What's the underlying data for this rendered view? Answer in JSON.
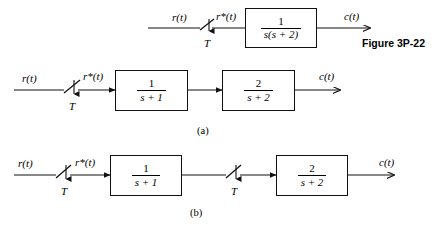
{
  "figure": {
    "caption": "Figure 3P-22",
    "caption_x": 362,
    "caption_y": 40
  },
  "labels": {
    "input": "r(t)",
    "sampled": "r*(t)",
    "output": "c(t)",
    "sampler_period": "T",
    "part_a": "(a)",
    "part_b": "(b)"
  },
  "blocks": {
    "top": {
      "numerator": "1",
      "denominator": "s(s + 2)"
    },
    "a_first": {
      "numerator": "1",
      "denominator": "s + 1"
    },
    "a_second": {
      "numerator": "2",
      "denominator": "s + 2"
    },
    "b_first": {
      "numerator": "1",
      "denominator": "s + 1"
    },
    "b_second": {
      "numerator": "2",
      "denominator": "s + 2"
    }
  },
  "diagrams": [
    {
      "id": "top",
      "name": "sampled-data-system-top",
      "line_y": 28,
      "input_label_x": 172,
      "input_label_y": 12,
      "sampler_x": 206,
      "sampler_T_x": 202,
      "sampler_T_y": 40,
      "sampled_label_x": 217,
      "sampled_label_y": 12,
      "block_x": 245,
      "block_y": 8,
      "block_w": 72,
      "block_h": 40,
      "output_label_x": 345,
      "output_label_y": 12,
      "wire_start_x": 148,
      "wire_end_x": 370
    },
    {
      "id": "a",
      "name": "sampled-data-system-a",
      "line_y": 90,
      "input_label_x": 22,
      "input_label_y": 72,
      "sampler_x": 70,
      "sampler_T_x": 66,
      "sampler_T_y": 103,
      "sampled_label_x": 84,
      "sampled_label_y": 71,
      "block1_x": 115,
      "block1_y": 70,
      "block1_w": 73,
      "block1_h": 41,
      "block2_x": 222,
      "block2_y": 70,
      "block2_w": 73,
      "block2_h": 41,
      "output_label_x": 320,
      "output_label_y": 71,
      "wire_start_x": 14,
      "wire_end_x": 340,
      "part_label_x": 200,
      "part_label_y": 128
    },
    {
      "id": "b",
      "name": "sampled-data-system-b",
      "line_y": 175,
      "input_label_x": 18,
      "input_label_y": 158,
      "sampler1_x": 62,
      "sampler1_T_x": 58,
      "sampler1_T_y": 188,
      "sampled_label_x": 76,
      "sampled_label_y": 157,
      "block1_x": 110,
      "block1_y": 155,
      "block1_w": 72,
      "block1_h": 41,
      "sampler2_x": 232,
      "sampler2_T_x": 228,
      "sampler2_T_y": 188,
      "block2_x": 276,
      "block2_y": 155,
      "block2_w": 72,
      "block2_h": 41,
      "output_label_x": 380,
      "output_label_y": 157,
      "wire_start_x": 14,
      "wire_end_x": 394,
      "part_label_x": 193,
      "part_label_y": 210
    }
  ],
  "colors": {
    "ink": "#111111",
    "background": "#ffffff"
  }
}
